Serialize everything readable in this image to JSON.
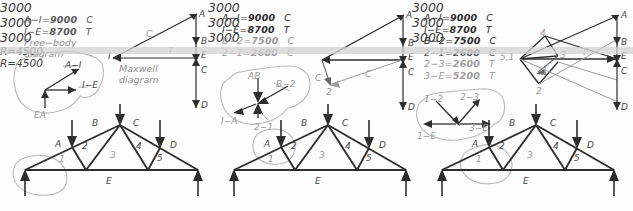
{
  "sheet": {
    "title": "Graphic statics worksheet: truss force analysis with Maxwell diagram",
    "ink_dark": "#2e2e2e",
    "ink_light": "#9d9d9d",
    "highlight": "#b9b9b9",
    "band_color": "#d2d2d2"
  },
  "panels": [
    {
      "id": "panel-1",
      "equations": [
        {
          "member": "A−I",
          "eq": "=",
          "value": "9000",
          "sense": "C"
        },
        {
          "member": "I−E",
          "eq": "=",
          "value": "8700",
          "sense": "T"
        }
      ],
      "caption_line1": "Free−body",
      "caption_line2": "diagram",
      "maxwell_caption_line1": "Maxwell",
      "maxwell_caption_line2": "diagram",
      "freebody_labels": [
        "A−I",
        "I−E",
        "EA"
      ],
      "maxwell_labels": {
        "apex": "A",
        "origin": "I",
        "diagonal": "C",
        "horizontal": "T",
        "load_line": [
          "A",
          "B",
          "E",
          "C",
          "D"
        ]
      },
      "truss": {
        "loads": [
          "3000",
          "3000",
          "3000"
        ],
        "joint_labels": [
          "A",
          "B",
          "C",
          "D",
          "E"
        ],
        "panel_numbers": [
          "1",
          "2",
          "3",
          "4",
          "5"
        ],
        "reactions": [
          "R=4500",
          "R=4500"
        ]
      }
    },
    {
      "id": "panel-2",
      "equations": [
        {
          "member": "A−I",
          "eq": "=",
          "value": "9000",
          "sense": "C"
        },
        {
          "member": "I−E",
          "eq": "=",
          "value": "8700",
          "sense": "T"
        },
        {
          "member": "B−2",
          "eq": "=",
          "value": "7500",
          "sense": "C"
        },
        {
          "member": "2−1",
          "eq": "=",
          "value": "2600",
          "sense": "C"
        }
      ],
      "freebody_labels": [
        "AB",
        "B−2",
        "I−A",
        "2−1"
      ],
      "maxwell_labels": {
        "apex": "A",
        "node_c": "C",
        "node_2": "2",
        "diagonal": "C",
        "load_line": [
          "A",
          "B",
          "E",
          "C",
          "D"
        ]
      },
      "truss": {
        "loads": [
          "3000",
          "3000",
          "3000"
        ],
        "joint_labels": [
          "A",
          "B",
          "C",
          "D",
          "E"
        ],
        "panel_numbers": [
          "1",
          "2",
          "3",
          "4",
          "5"
        ],
        "reactions": []
      }
    },
    {
      "id": "panel-3",
      "equations": [
        {
          "member": "A−I",
          "eq": "=",
          "value": "9000",
          "sense": "C"
        },
        {
          "member": "I−E",
          "eq": "=",
          "value": "8700",
          "sense": "T"
        },
        {
          "member": "B−2",
          "eq": "=",
          "value": "7500",
          "sense": "C"
        },
        {
          "member": "2−1",
          "eq": "=",
          "value": "2600",
          "sense": "C"
        },
        {
          "member": "2−3",
          "eq": "=",
          "value": "2600",
          "sense": "T"
        },
        {
          "member": "3−E",
          "eq": "=",
          "value": "5200",
          "sense": "T"
        }
      ],
      "freebody_labels": [
        "1−2",
        "2−3",
        "3−E",
        "1−E"
      ],
      "maxwell_labels": {
        "apex": "A",
        "node_4": "4",
        "node_3": "3",
        "node_2": "2",
        "node_1": "1",
        "node_51": "5,1",
        "horizontal": "T",
        "load_line": [
          "A",
          "B",
          "E",
          "C",
          "D"
        ]
      },
      "truss": {
        "loads": [
          "3000",
          "3000",
          "3000"
        ],
        "joint_labels": [
          "A",
          "B",
          "C",
          "D",
          "E"
        ],
        "panel_numbers": [
          "1",
          "2",
          "3",
          "4",
          "5"
        ],
        "reactions": []
      }
    }
  ]
}
